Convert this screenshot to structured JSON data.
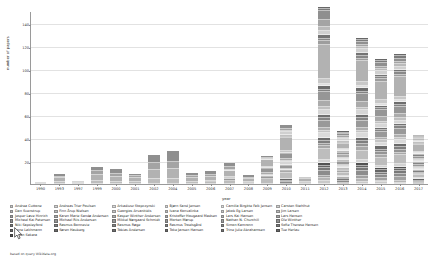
{
  "chart_data": {
    "type": "bar",
    "stacked": true,
    "title": "",
    "xlabel": "year",
    "ylabel": "number of papers",
    "ylim": [
      0,
      150
    ],
    "yticks": [
      20,
      40,
      60,
      80,
      100,
      120,
      140
    ],
    "grid": true,
    "legend_position": "bottom",
    "categories": [
      "1990",
      "1993",
      "1997",
      "1999",
      "2000",
      "2001",
      "2002",
      "2004",
      "2005",
      "2006",
      "2007",
      "2008",
      "2009",
      "2010",
      "2011",
      "2012",
      "2013",
      "2014",
      "2015",
      "2016",
      "2017"
    ],
    "totals": [
      2,
      9,
      3,
      16,
      13,
      9,
      25,
      29,
      10,
      11,
      18,
      8,
      24,
      48,
      6,
      139,
      21,
      97,
      86,
      91,
      31
    ],
    "series": [
      {
        "name": "Andrea Cuttone",
        "color": "#c9c9c9",
        "values": [
          0,
          0,
          0,
          0,
          0,
          0,
          0,
          0,
          0,
          0,
          0,
          0,
          0,
          0,
          0,
          3,
          0,
          2,
          2,
          1,
          0
        ]
      },
      {
        "name": "Dan Svenstrup",
        "color": "#b5b5b5",
        "values": [
          0,
          0,
          0,
          0,
          0,
          0,
          0,
          0,
          0,
          0,
          0,
          0,
          0,
          0,
          0,
          2,
          0,
          2,
          1,
          2,
          0
        ]
      },
      {
        "name": "Jesper Løve Hinrich",
        "color": "#a0a0a0",
        "values": [
          0,
          0,
          0,
          0,
          0,
          0,
          0,
          0,
          0,
          0,
          0,
          0,
          0,
          0,
          0,
          2,
          1,
          3,
          2,
          3,
          1
        ]
      },
      {
        "name": "Michael Kai Petersen",
        "color": "#8c8c8c",
        "values": [
          0,
          0,
          0,
          0,
          0,
          0,
          0,
          0,
          0,
          0,
          0,
          0,
          0,
          2,
          0,
          4,
          2,
          4,
          3,
          3,
          1
        ]
      },
      {
        "name": "Niki Sapsleyford",
        "color": "#787878",
        "values": [
          0,
          0,
          0,
          0,
          0,
          0,
          0,
          0,
          0,
          0,
          0,
          0,
          0,
          1,
          0,
          3,
          1,
          3,
          2,
          2,
          1
        ]
      },
      {
        "name": "Lone Lakhmann",
        "color": "#656565",
        "values": [
          0,
          0,
          0,
          0,
          0,
          0,
          0,
          0,
          0,
          0,
          0,
          0,
          0,
          1,
          0,
          2,
          1,
          2,
          2,
          2,
          1
        ]
      },
      {
        "name": "Johan Sakara",
        "color": "#525252",
        "values": [
          0,
          0,
          0,
          0,
          0,
          0,
          0,
          0,
          0,
          0,
          0,
          0,
          0,
          0,
          0,
          2,
          1,
          2,
          2,
          2,
          0
        ]
      },
      {
        "name": "Andreas Trier Poulsen",
        "color": "#d2d2d2",
        "values": [
          0,
          0,
          0,
          0,
          0,
          0,
          0,
          0,
          0,
          0,
          0,
          0,
          0,
          0,
          0,
          3,
          1,
          3,
          2,
          2,
          1
        ]
      },
      {
        "name": "Finn Årup Nielsen",
        "color": "#bdbdbd",
        "values": [
          1,
          2,
          1,
          3,
          2,
          2,
          4,
          4,
          2,
          2,
          3,
          1,
          4,
          6,
          1,
          9,
          3,
          8,
          7,
          8,
          3
        ]
      },
      {
        "name": "Karen Marie Sandø Andersen",
        "color": "#a8a8a8",
        "values": [
          0,
          0,
          0,
          0,
          0,
          0,
          0,
          0,
          0,
          0,
          0,
          0,
          0,
          1,
          0,
          3,
          1,
          3,
          2,
          2,
          1
        ]
      },
      {
        "name": "Michael Riis Andersen",
        "color": "#949494",
        "values": [
          0,
          0,
          0,
          0,
          0,
          0,
          0,
          0,
          0,
          0,
          0,
          0,
          0,
          0,
          0,
          2,
          1,
          3,
          3,
          3,
          1
        ]
      },
      {
        "name": "Rasmus Bonnevie",
        "color": "#7f7f7f",
        "values": [
          0,
          0,
          0,
          0,
          0,
          0,
          0,
          0,
          0,
          0,
          0,
          0,
          0,
          0,
          0,
          2,
          1,
          2,
          2,
          2,
          1
        ]
      },
      {
        "name": "Søren Hauberg",
        "color": "#6b6b6b",
        "values": [
          0,
          0,
          0,
          0,
          0,
          0,
          0,
          0,
          0,
          0,
          0,
          0,
          0,
          1,
          0,
          3,
          1,
          3,
          3,
          3,
          1
        ]
      },
      {
        "name": "Arkadiusz Stopczynski",
        "color": "#dadada",
        "values": [
          0,
          0,
          0,
          0,
          0,
          0,
          0,
          0,
          0,
          0,
          0,
          0,
          0,
          1,
          0,
          4,
          1,
          4,
          3,
          3,
          1
        ]
      },
      {
        "name": "Georgios Arvanitidis",
        "color": "#c4c4c4",
        "values": [
          0,
          0,
          0,
          0,
          0,
          0,
          0,
          0,
          0,
          0,
          0,
          0,
          0,
          0,
          0,
          2,
          1,
          2,
          2,
          2,
          1
        ]
      },
      {
        "name": "Kasper Winther Andersen",
        "color": "#aeaeae",
        "values": [
          0,
          0,
          0,
          0,
          0,
          0,
          0,
          0,
          0,
          0,
          0,
          0,
          0,
          0,
          0,
          3,
          1,
          3,
          2,
          3,
          1
        ]
      },
      {
        "name": "Mikkel Nørgaard Schmidt",
        "color": "#999999",
        "values": [
          0,
          0,
          0,
          0,
          0,
          0,
          0,
          0,
          0,
          0,
          1,
          0,
          2,
          3,
          0,
          6,
          2,
          6,
          5,
          5,
          2
        ]
      },
      {
        "name": "Rasmus Røge",
        "color": "#858585",
        "values": [
          0,
          0,
          0,
          0,
          0,
          0,
          0,
          0,
          0,
          0,
          0,
          0,
          0,
          0,
          0,
          2,
          1,
          2,
          2,
          2,
          1
        ]
      },
      {
        "name": "Tobias Andersen",
        "color": "#707070",
        "values": [
          0,
          0,
          0,
          0,
          0,
          0,
          0,
          0,
          0,
          0,
          0,
          0,
          1,
          1,
          0,
          3,
          1,
          3,
          2,
          2,
          1
        ]
      },
      {
        "name": "Bjørn Sand Jensen",
        "color": "#d6d6d6",
        "values": [
          0,
          0,
          0,
          0,
          0,
          0,
          0,
          0,
          0,
          0,
          0,
          0,
          1,
          2,
          0,
          4,
          1,
          4,
          3,
          3,
          1
        ]
      },
      {
        "name": "Ivana Konvalinka",
        "color": "#c0c0c0",
        "values": [
          0,
          0,
          0,
          0,
          0,
          0,
          0,
          0,
          0,
          0,
          0,
          0,
          0,
          1,
          0,
          3,
          1,
          2,
          2,
          2,
          1
        ]
      },
      {
        "name": "Kristoffer Hougaard Madsen",
        "color": "#ababab",
        "values": [
          0,
          0,
          0,
          0,
          0,
          0,
          0,
          0,
          0,
          0,
          1,
          0,
          2,
          2,
          0,
          5,
          2,
          5,
          4,
          4,
          1
        ]
      },
      {
        "name": "Morten Mørup",
        "color": "#969696",
        "values": [
          0,
          0,
          0,
          0,
          0,
          0,
          0,
          0,
          0,
          1,
          1,
          1,
          3,
          4,
          1,
          8,
          2,
          7,
          6,
          6,
          2
        ]
      },
      {
        "name": "Rasmus Troelsgård",
        "color": "#828282",
        "values": [
          0,
          0,
          0,
          0,
          0,
          0,
          0,
          0,
          0,
          0,
          0,
          0,
          0,
          0,
          0,
          2,
          1,
          2,
          2,
          2,
          1
        ]
      },
      {
        "name": "Toke Jansen Hansen",
        "color": "#6d6d6d",
        "values": [
          0,
          0,
          0,
          0,
          0,
          0,
          0,
          0,
          0,
          0,
          0,
          0,
          1,
          1,
          0,
          3,
          1,
          3,
          2,
          2,
          1
        ]
      },
      {
        "name": "Camilla Birgitte Falk Jensen",
        "color": "#dedede",
        "values": [
          0,
          0,
          0,
          0,
          0,
          0,
          0,
          0,
          0,
          0,
          0,
          0,
          0,
          0,
          0,
          2,
          1,
          2,
          2,
          2,
          1
        ]
      },
      {
        "name": "Jakob Eg Larsen",
        "color": "#c8c8c8",
        "values": [
          0,
          0,
          0,
          0,
          0,
          0,
          0,
          0,
          0,
          0,
          0,
          0,
          1,
          2,
          0,
          4,
          1,
          4,
          3,
          3,
          1
        ]
      },
      {
        "name": "Lars Kai Hansen",
        "color": "#b2b2b2",
        "values": [
          1,
          3,
          1,
          5,
          4,
          3,
          8,
          9,
          3,
          3,
          5,
          2,
          6,
          11,
          2,
          30,
          4,
          18,
          16,
          17,
          6
        ]
      },
      {
        "name": "Nathan N. Churchill",
        "color": "#9d9d9d",
        "values": [
          0,
          0,
          0,
          0,
          0,
          0,
          0,
          0,
          0,
          0,
          0,
          0,
          0,
          1,
          0,
          3,
          1,
          2,
          2,
          2,
          1
        ]
      },
      {
        "name": "Simon Kamronn",
        "color": "#888888",
        "values": [
          0,
          0,
          0,
          0,
          0,
          0,
          0,
          0,
          0,
          0,
          0,
          0,
          0,
          1,
          0,
          2,
          1,
          2,
          2,
          2,
          1
        ]
      },
      {
        "name": "Trine Julie Abrahamsen",
        "color": "#747474",
        "values": [
          0,
          0,
          0,
          0,
          0,
          0,
          0,
          0,
          0,
          0,
          0,
          0,
          0,
          1,
          0,
          3,
          1,
          3,
          2,
          2,
          1
        ]
      },
      {
        "name": "Carsten Stahlhut",
        "color": "#d0d0d0",
        "values": [
          0,
          0,
          0,
          0,
          0,
          0,
          0,
          0,
          0,
          0,
          1,
          0,
          1,
          2,
          0,
          4,
          1,
          3,
          3,
          3,
          1
        ]
      },
      {
        "name": "Jim Larsen",
        "color": "#bababa",
        "values": [
          0,
          0,
          0,
          0,
          0,
          0,
          0,
          0,
          0,
          0,
          0,
          0,
          0,
          1,
          0,
          3,
          1,
          2,
          2,
          2,
          1
        ]
      },
      {
        "name": "Lars Hansen",
        "color": "#a4a4a4",
        "values": [
          0,
          1,
          1,
          3,
          3,
          2,
          6,
          6,
          2,
          2,
          3,
          1,
          1,
          2,
          1,
          6,
          2,
          2,
          2,
          2,
          1
        ]
      },
      {
        "name": "Ole Winther",
        "color": "#8f8f8f",
        "values": [
          0,
          3,
          0,
          4,
          4,
          2,
          7,
          10,
          3,
          3,
          3,
          3,
          1,
          3,
          1,
          8,
          2,
          2,
          3,
          3,
          1
        ]
      },
      {
        "name": "Sofie Therese Hansen",
        "color": "#7b7b7b",
        "values": [
          0,
          0,
          0,
          0,
          0,
          0,
          0,
          0,
          0,
          0,
          0,
          0,
          0,
          0,
          0,
          2,
          1,
          2,
          2,
          2,
          1
        ]
      },
      {
        "name": "Tue Herlau",
        "color": "#676767",
        "values": [
          0,
          0,
          0,
          0,
          0,
          0,
          0,
          0,
          0,
          0,
          0,
          0,
          0,
          0,
          0,
          2,
          1,
          2,
          2,
          2,
          1
        ]
      }
    ]
  },
  "axis": {
    "ylabel": "number of papers",
    "xlabel": "year"
  },
  "legend": {
    "columns": [
      {
        "items": [
          {
            "label": "Andrea Cuttone",
            "color": "#c9c9c9"
          },
          {
            "label": "Dan Svenstrup",
            "color": "#b5b5b5"
          },
          {
            "label": "Jesper Løve Hinrich",
            "color": "#a0a0a0"
          },
          {
            "label": "Michael Kai Petersen",
            "color": "#8c8c8c"
          },
          {
            "label": "Niki Sapsleyford",
            "color": "#787878"
          },
          {
            "label": "Lone Lakhmann",
            "color": "#656565"
          },
          {
            "label": "Johan Sakara",
            "color": "#525252"
          }
        ]
      },
      {
        "items": [
          {
            "label": "Andreas Trier Poulsen",
            "color": "#d2d2d2"
          },
          {
            "label": "Finn Årup Nielsen",
            "color": "#bdbdbd"
          },
          {
            "label": "Karen Marie Sandø Andersen",
            "color": "#a8a8a8"
          },
          {
            "label": "Michael Riis Andersen",
            "color": "#949494"
          },
          {
            "label": "Rasmus Bonnevie",
            "color": "#7f7f7f"
          },
          {
            "label": "Søren Hauberg",
            "color": "#6b6b6b"
          }
        ]
      },
      {
        "items": [
          {
            "label": "Arkadiusz Stopczynski",
            "color": "#dadada"
          },
          {
            "label": "Georgios Arvanitidis",
            "color": "#c4c4c4"
          },
          {
            "label": "Kasper Winther Andersen",
            "color": "#aeaeae"
          },
          {
            "label": "Mikkel Nørgaard Schmidt",
            "color": "#999999"
          },
          {
            "label": "Rasmus Røge",
            "color": "#858585"
          },
          {
            "label": "Tobias Andersen",
            "color": "#707070"
          }
        ]
      },
      {
        "items": [
          {
            "label": "Bjørn Sand Jensen",
            "color": "#d6d6d6"
          },
          {
            "label": "Ivana Konvalinka",
            "color": "#c0c0c0"
          },
          {
            "label": "Kristoffer Hougaard Madsen",
            "color": "#ababab"
          },
          {
            "label": "Morten Mørup",
            "color": "#969696"
          },
          {
            "label": "Rasmus Troelsgård",
            "color": "#828282"
          },
          {
            "label": "Toke Jansen Hansen",
            "color": "#6d6d6d"
          }
        ]
      },
      {
        "items": [
          {
            "label": "Camilla Birgitte Falk Jensen",
            "color": "#dedede"
          },
          {
            "label": "Jakob Eg Larsen",
            "color": "#c8c8c8"
          },
          {
            "label": "Lars Kai Hansen",
            "color": "#b2b2b2"
          },
          {
            "label": "Nathan N. Churchill",
            "color": "#9d9d9d"
          },
          {
            "label": "Simon Kamronn",
            "color": "#888888"
          },
          {
            "label": "Trine Julie Abrahamsen",
            "color": "#747474"
          }
        ]
      },
      {
        "items": [
          {
            "label": "Carsten Stahlhut",
            "color": "#d0d0d0"
          },
          {
            "label": "Jim Larsen",
            "color": "#bababa"
          },
          {
            "label": "Lars Hansen",
            "color": "#a4a4a4"
          },
          {
            "label": "Ole Winther",
            "color": "#8f8f8f"
          },
          {
            "label": "Sofie Therese Hansen",
            "color": "#7b7b7b"
          },
          {
            "label": "Tue Herlau",
            "color": "#676767"
          }
        ]
      }
    ]
  },
  "footer": {
    "text": "based on query Wikidata.org"
  }
}
